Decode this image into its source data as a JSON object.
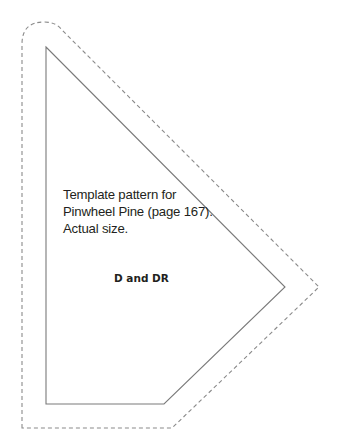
{
  "caption": {
    "lines": [
      "Template pattern for",
      "Pinwheel Pine (page 167).",
      "Actual size."
    ]
  },
  "piece_label": "D and DR",
  "colors": {
    "cut_line": "#7a7a7a",
    "seam_allowance_dashed": "#8a8a8a",
    "text": "#231f20"
  }
}
